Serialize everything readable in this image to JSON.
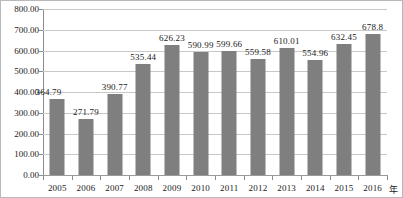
{
  "chart_data": {
    "type": "bar",
    "title": "",
    "subtitle": "",
    "xlabel": "年",
    "ylabel": "",
    "categories": [
      "2005",
      "2006",
      "2007",
      "2008",
      "2009",
      "2010",
      "2011",
      "2012",
      "2013",
      "2014",
      "2015",
      "2016"
    ],
    "values": [
      364.79,
      271.79,
      390.77,
      535.44,
      626.23,
      590.99,
      599.66,
      559.58,
      610.01,
      554.96,
      632.45,
      678.8
    ],
    "value_labels": [
      "364.79",
      "271.79",
      "390.77",
      "535.44",
      "626.23",
      "590.99",
      "599.66",
      "559.58",
      "610.01",
      "554.96",
      "632.45",
      "678.8"
    ],
    "ylim": [
      0,
      800
    ],
    "ytick_step": 100,
    "ytick_labels": [
      "800.00",
      "700.00",
      "600.00",
      "500.00",
      "400.00",
      "300.00",
      "200.00",
      "100.00",
      "0.00"
    ],
    "ytick_values": [
      800,
      700,
      600,
      500,
      400,
      300,
      200,
      100,
      0
    ],
    "grid": true,
    "legend": false,
    "legend_position": "none",
    "series": [
      {
        "name": "",
        "values": [
          364.79,
          271.79,
          390.77,
          535.44,
          626.23,
          590.99,
          599.66,
          559.58,
          610.01,
          554.96,
          632.45,
          678.8
        ]
      }
    ],
    "colors": {
      "bar": "#7f7f7f",
      "gridline": "#c8c8c8",
      "axis": "#8d8d8d",
      "text": "#1a1a1a",
      "frame": "#b9b9b9",
      "background": "#ffffff"
    }
  }
}
